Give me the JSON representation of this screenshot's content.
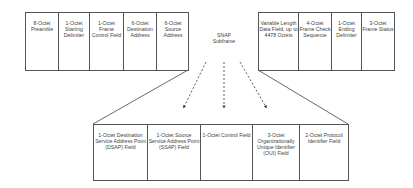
{
  "top_frame": {
    "left_fields": [
      {
        "label": "8-Octet Preamble"
      },
      {
        "label": "1-Octet Starting Delimiter"
      },
      {
        "label": "1-Octet Frame Control Field"
      },
      {
        "label": "6-Octet Destination Address"
      },
      {
        "label": "6-Octet Source Address"
      }
    ],
    "snap_label": "SNAP Subframe",
    "right_fields": [
      {
        "label": "Variable Length Data Field, up to 4478 Octets"
      },
      {
        "label": "4-Octet Frame Check Sequence"
      },
      {
        "label": "1-Octet Ending Delimiter"
      },
      {
        "label": "3-Octet Frame Status"
      }
    ]
  },
  "snap_subframe": {
    "fields": [
      {
        "label": "1-Octet Destination Service Address Point (DSAP) Field"
      },
      {
        "label": "1-Octet Source Service Address Point (SSAP) Field"
      },
      {
        "label": "1-Octet Control Field"
      },
      {
        "label": "3-Octet Organizationally Unique Identifier (OUI) Field"
      },
      {
        "label": "2-Octet Protocol Identifier Field"
      }
    ]
  }
}
